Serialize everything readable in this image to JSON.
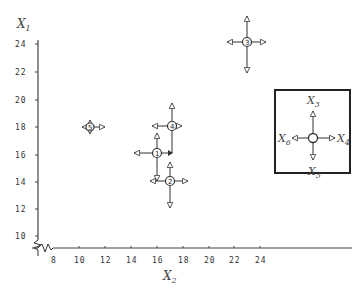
{
  "figure": {
    "y_axis": {
      "title": "X",
      "subscript": "1",
      "ticks": [
        "24",
        "22",
        "20",
        "18",
        "16",
        "14",
        "12",
        "10"
      ]
    },
    "x_axis": {
      "title": "X",
      "subscript": "2",
      "ticks": [
        "8",
        "10",
        "12",
        "14",
        "16",
        "18",
        "20",
        "22",
        "24"
      ]
    },
    "points": [
      {
        "label": "1",
        "x2": 16,
        "x1": 16
      },
      {
        "label": "2",
        "x2": 17,
        "x1": 14
      },
      {
        "label": "3",
        "x2": 23,
        "x1": 24
      },
      {
        "label": "4",
        "x2": 17,
        "x1": 18
      },
      {
        "label": "5",
        "x2": 11,
        "x1": 18
      }
    ],
    "legend": {
      "up": "X3",
      "right": "X4",
      "down": "X5",
      "left": "X6",
      "up_label": {
        "main": "X",
        "sub": "3"
      },
      "right_label": {
        "main": "X",
        "sub": "4"
      },
      "down_label": {
        "main": "X",
        "sub": "5"
      },
      "left_label": {
        "main": "X",
        "sub": "6"
      }
    },
    "colors": {
      "ink": "#333333",
      "background": "#ffffff"
    }
  }
}
